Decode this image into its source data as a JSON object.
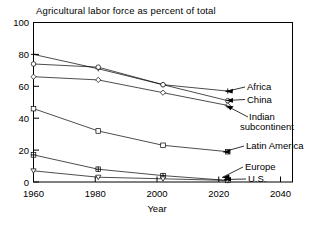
{
  "chart_data": {
    "type": "line",
    "title": "Agricultural labor force as percent of total",
    "xlabel": "Year",
    "ylabel": "",
    "x": [
      1960,
      1980,
      2000,
      2020
    ],
    "xticks": [
      "1960",
      "1980",
      "2000",
      "2020",
      "2040"
    ],
    "xtick_values": [
      1960,
      1980,
      2000,
      2020,
      2040
    ],
    "yticks": [
      "0",
      "20",
      "40",
      "60",
      "80",
      "100"
    ],
    "ytick_values": [
      0,
      20,
      40,
      60,
      80,
      100
    ],
    "xlim": [
      1960,
      2040
    ],
    "ylim": [
      0,
      100
    ],
    "grid": false,
    "legend_position": "right-inline-annotations",
    "series": [
      {
        "name": "Africa",
        "marker": "plus",
        "values": [
          80,
          71,
          61,
          57
        ]
      },
      {
        "name": "China",
        "marker": "circle",
        "values": [
          74,
          72,
          61,
          51
        ]
      },
      {
        "name": "Indian subcontinent",
        "marker": "diamond",
        "values": [
          66,
          64,
          56,
          48
        ]
      },
      {
        "name": "Latin America",
        "marker": "square",
        "values": [
          46,
          32,
          23,
          19
        ]
      },
      {
        "name": "Europe",
        "marker": "square-plus",
        "values": [
          17,
          8,
          4,
          1
        ]
      },
      {
        "name": "U.S.",
        "marker": "triangle-down",
        "values": [
          7,
          3,
          2,
          1
        ]
      }
    ],
    "annotations": [
      {
        "label": "Africa",
        "line_index": 0
      },
      {
        "label": "China",
        "line_index": 1
      },
      {
        "label": "Indian",
        "line_index": 2
      },
      {
        "label": "subcontinent",
        "line_index": 2
      },
      {
        "label": "Latin America",
        "line_index": 3
      },
      {
        "label": "Europe",
        "line_index": 4
      },
      {
        "label": "U.S.",
        "line_index": 5
      }
    ]
  }
}
